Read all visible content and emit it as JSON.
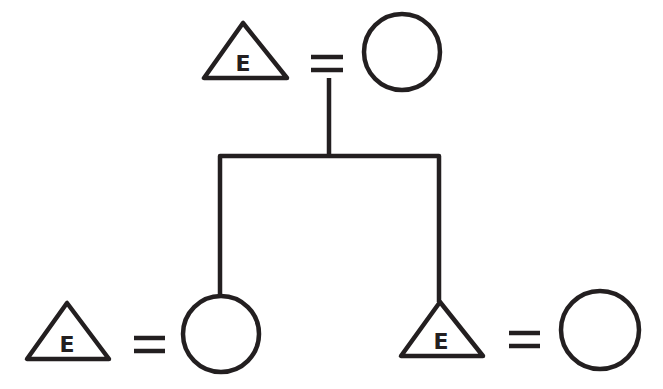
{
  "diagram": {
    "type": "kinship-chart",
    "colors": {
      "line": "#231f20",
      "background": "#ffffff"
    },
    "generations": [
      {
        "level": 1,
        "couple": {
          "male": {
            "shape": "triangle",
            "label": "E"
          },
          "marriage_symbol": "=",
          "female": {
            "shape": "circle",
            "label": ""
          }
        }
      },
      {
        "level": 2,
        "couples": [
          {
            "male": {
              "shape": "triangle",
              "label": "E"
            },
            "marriage_symbol": "=",
            "female": {
              "shape": "circle",
              "label": "",
              "child_of_level_1": true
            }
          },
          {
            "male": {
              "shape": "triangle",
              "label": "E",
              "child_of_level_1": true
            },
            "marriage_symbol": "=",
            "female": {
              "shape": "circle",
              "label": ""
            }
          }
        ]
      }
    ]
  }
}
